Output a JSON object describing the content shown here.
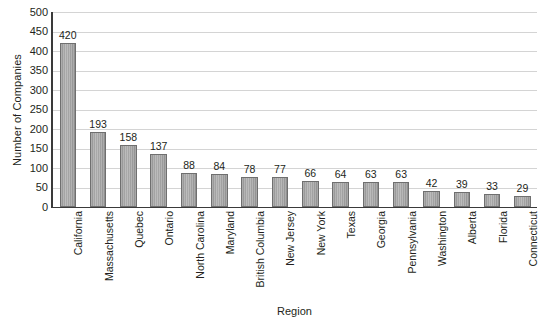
{
  "chart_data": {
    "type": "bar",
    "title": "",
    "xlabel": "Region",
    "ylabel": "Number of Companies",
    "ylim": [
      0,
      500
    ],
    "ytick_step": 50,
    "yticks": [
      500,
      450,
      400,
      350,
      300,
      250,
      200,
      150,
      100,
      50,
      0
    ],
    "grid": true,
    "legend": "none",
    "orientation": "vertical",
    "value_labels": true,
    "categories": [
      "California",
      "Massachusetts",
      "Quebec",
      "Ontario",
      "North Carolina",
      "Maryland",
      "British Columbia",
      "New Jersey",
      "New York",
      "Texas",
      "Georgia",
      "Pennsylvania",
      "Washington",
      "Alberta",
      "Florida",
      "Connecticut"
    ],
    "values": [
      420,
      193,
      158,
      137,
      88,
      84,
      78,
      77,
      66,
      64,
      63,
      63,
      42,
      39,
      33,
      29
    ],
    "colors": {
      "bar_fill": "#a8a8a8",
      "bar_border": "#6f6f6f",
      "gridline": "#d4d4d4",
      "axis_line": "#3a3a3a",
      "text": "#231f20",
      "background": "#ffffff"
    }
  }
}
